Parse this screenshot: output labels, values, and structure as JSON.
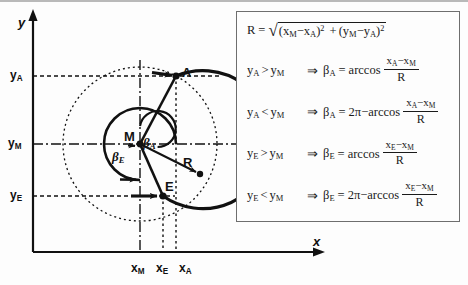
{
  "diagram": {
    "axes": {
      "y_axis_label": "y",
      "x_axis_label": "x"
    },
    "y_ticks": [
      {
        "id": "yA",
        "label": "y",
        "sub": "A",
        "value_y": 76
      },
      {
        "id": "yM",
        "label": "y",
        "sub": "M",
        "value_y": 144
      },
      {
        "id": "yE",
        "label": "y",
        "sub": "E",
        "value_y": 196
      }
    ],
    "x_ticks": [
      {
        "id": "xM",
        "label": "x",
        "sub": "M",
        "value_x": 140
      },
      {
        "id": "xE",
        "label": "x",
        "sub": "E",
        "value_x": 163
      },
      {
        "id": "xA",
        "label": "x",
        "sub": "A",
        "value_x": 177
      }
    ],
    "points": [
      {
        "id": "M",
        "label": "M",
        "x": 140,
        "y": 144
      },
      {
        "id": "A",
        "label": "A",
        "x": 176,
        "y": 76
      },
      {
        "id": "E",
        "label": "E",
        "x": 163,
        "y": 196
      }
    ],
    "angles": [
      {
        "id": "betaA",
        "label": "β",
        "sub": "A"
      },
      {
        "id": "betaE",
        "label": "β",
        "sub": "E"
      }
    ],
    "radius": {
      "label": "R"
    }
  },
  "formulas": {
    "r_definition": {
      "lhs": "R",
      "equals": "=",
      "sqrt_glyph": "√",
      "term1_open": "(x",
      "term1_sub1": "M",
      "term1_minus": "−x",
      "term1_sub2": "A",
      "term1_close": ")",
      "term1_pow": "2",
      "plus": "+",
      "term2_open": "(y",
      "term2_sub1": "M",
      "term2_minus": "−y",
      "term2_sub2": "A",
      "term2_close": ")",
      "term2_pow": "2"
    },
    "conditions": [
      {
        "id": "cond-a-gt",
        "lhs_var": "y",
        "lhs_sub": "A",
        "operator": ">",
        "rhs_var": "y",
        "rhs_sub": "M",
        "implies": "⇒",
        "beta": "β",
        "beta_sub": "A",
        "eq": "=",
        "prefix": "",
        "func": "arccos",
        "num_a": "x",
        "num_a_sub": "A",
        "num_minus": "−x",
        "num_b_sub": "M",
        "den": "R"
      },
      {
        "id": "cond-a-lt",
        "lhs_var": "y",
        "lhs_sub": "A",
        "operator": "<",
        "rhs_var": "y",
        "rhs_sub": "M",
        "implies": "⇒",
        "beta": "β",
        "beta_sub": "A",
        "eq": "=",
        "prefix": "2π−",
        "func": "arccos",
        "num_a": "x",
        "num_a_sub": "A",
        "num_minus": "−x",
        "num_b_sub": "M",
        "den": "R"
      },
      {
        "id": "cond-e-gt",
        "lhs_var": "y",
        "lhs_sub": "E",
        "operator": ">",
        "rhs_var": "y",
        "rhs_sub": "M",
        "implies": "⇒",
        "beta": "β",
        "beta_sub": "E",
        "eq": "=",
        "prefix": "",
        "func": "arccos",
        "num_a": "x",
        "num_a_sub": "E",
        "num_minus": "−x",
        "num_b_sub": "M",
        "den": "R"
      },
      {
        "id": "cond-e-lt",
        "lhs_var": "y",
        "lhs_sub": "E",
        "operator": "<",
        "rhs_var": "y",
        "rhs_sub": "M",
        "implies": "⇒",
        "beta": "β",
        "beta_sub": "E",
        "eq": "=",
        "prefix": "2π−",
        "func": "arccos",
        "num_a": "x",
        "num_a_sub": "E",
        "num_minus": "−x",
        "num_b_sub": "M",
        "den": "R"
      }
    ]
  },
  "colors": {
    "ink": "#111111",
    "panel_border": "#6e6e6e",
    "background": "#fdfdfd"
  }
}
